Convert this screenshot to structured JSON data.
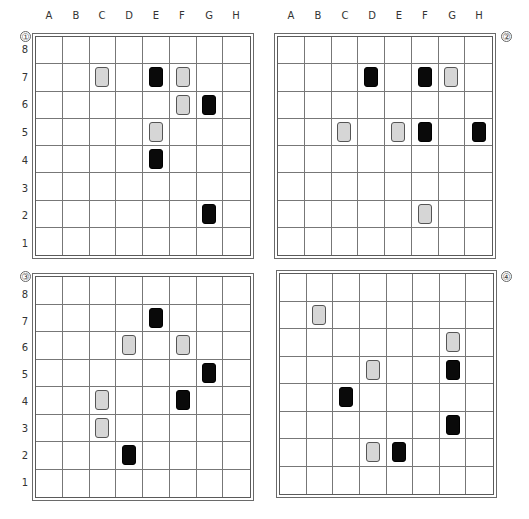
{
  "columns": [
    "A",
    "B",
    "C",
    "D",
    "E",
    "F",
    "G",
    "H"
  ],
  "rows": [
    "8",
    "7",
    "6",
    "5",
    "4",
    "3",
    "2",
    "1"
  ],
  "colors": {
    "gray_card": "#d6d6d6",
    "black_card": "#0a0a0a",
    "grid_line": "#777777"
  },
  "boards": [
    {
      "id": 1,
      "label": "①",
      "show_col_labels": true,
      "show_row_labels": true,
      "pieces": [
        {
          "col": "C",
          "row": 7,
          "color": "gray"
        },
        {
          "col": "E",
          "row": 7,
          "color": "black"
        },
        {
          "col": "F",
          "row": 7,
          "color": "gray"
        },
        {
          "col": "F",
          "row": 6,
          "color": "gray"
        },
        {
          "col": "G",
          "row": 6,
          "color": "black"
        },
        {
          "col": "E",
          "row": 5,
          "color": "gray"
        },
        {
          "col": "E",
          "row": 4,
          "color": "black"
        },
        {
          "col": "G",
          "row": 2,
          "color": "black"
        }
      ]
    },
    {
      "id": 2,
      "label": "②",
      "show_col_labels": true,
      "show_row_labels": false,
      "pieces": [
        {
          "col": "D",
          "row": 7,
          "color": "black"
        },
        {
          "col": "F",
          "row": 7,
          "color": "black"
        },
        {
          "col": "G",
          "row": 7,
          "color": "gray"
        },
        {
          "col": "C",
          "row": 5,
          "color": "gray"
        },
        {
          "col": "E",
          "row": 5,
          "color": "gray"
        },
        {
          "col": "F",
          "row": 5,
          "color": "black"
        },
        {
          "col": "H",
          "row": 5,
          "color": "black"
        },
        {
          "col": "F",
          "row": 2,
          "color": "gray"
        }
      ]
    },
    {
      "id": 3,
      "label": "③",
      "show_col_labels": false,
      "show_row_labels": true,
      "pieces": [
        {
          "col": "E",
          "row": 7,
          "color": "black"
        },
        {
          "col": "D",
          "row": 6,
          "color": "gray"
        },
        {
          "col": "F",
          "row": 6,
          "color": "gray"
        },
        {
          "col": "G",
          "row": 5,
          "color": "black"
        },
        {
          "col": "C",
          "row": 4,
          "color": "gray"
        },
        {
          "col": "F",
          "row": 4,
          "color": "black"
        },
        {
          "col": "C",
          "row": 3,
          "color": "gray"
        },
        {
          "col": "D",
          "row": 2,
          "color": "black"
        }
      ]
    },
    {
      "id": 4,
      "label": "④",
      "show_col_labels": false,
      "show_row_labels": false,
      "pieces": [
        {
          "col": "B",
          "row": 7,
          "color": "gray"
        },
        {
          "col": "G",
          "row": 6,
          "color": "gray"
        },
        {
          "col": "D",
          "row": 5,
          "color": "gray"
        },
        {
          "col": "G",
          "row": 5,
          "color": "black"
        },
        {
          "col": "C",
          "row": 4,
          "color": "black"
        },
        {
          "col": "G",
          "row": 3,
          "color": "black"
        },
        {
          "col": "D",
          "row": 2,
          "color": "gray"
        },
        {
          "col": "E",
          "row": 2,
          "color": "black"
        }
      ]
    }
  ]
}
